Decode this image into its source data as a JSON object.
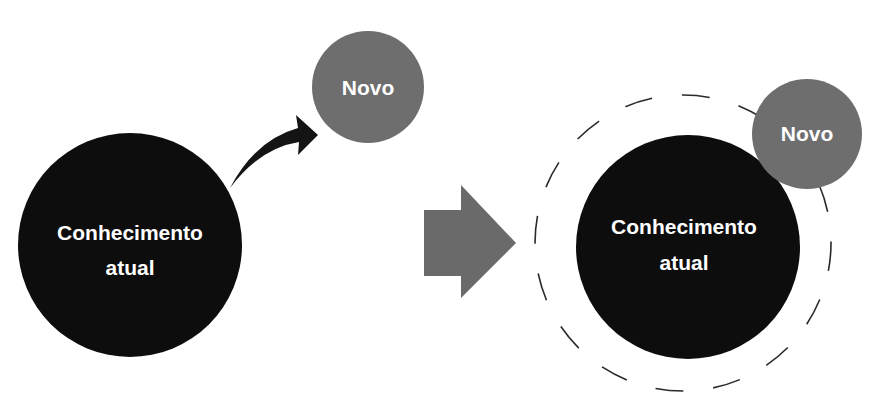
{
  "colors": {
    "background": "#ffffff",
    "current_knowledge_fill": "#0d0d0d",
    "new_fill": "#6e6e6e",
    "block_arrow_fill": "#6a6a6a",
    "curved_arrow_fill": "#141414",
    "dashed_ring_stroke": "#2a2a2a",
    "text": "#ffffff"
  },
  "before": {
    "current_knowledge": {
      "line1": "Conhecimento",
      "line2": "atual"
    },
    "new": {
      "label": "Novo"
    },
    "connector": "curved-arrow"
  },
  "transition": {
    "connector": "block-arrow-right"
  },
  "after": {
    "current_knowledge": {
      "line1": "Conhecimento",
      "line2": "atual"
    },
    "new": {
      "label": "Novo"
    },
    "boundary": "dashed-circle"
  }
}
